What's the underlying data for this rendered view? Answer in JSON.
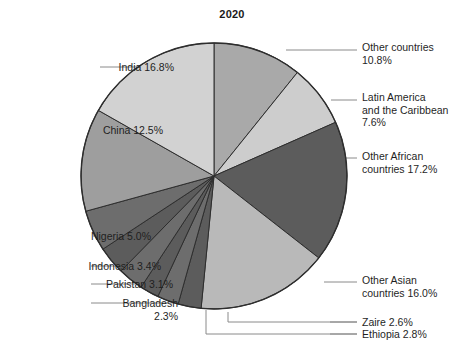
{
  "chart": {
    "title": "2020"
  },
  "chart_data": {
    "type": "pie",
    "title": "2020",
    "xlabel": "",
    "ylabel": "",
    "legend_position": "callout-labels",
    "grid": false,
    "units": "percent",
    "start_angle_deg": 0,
    "direction": "clockwise",
    "categories": [
      "Other countries",
      "Latin America and the Caribbean",
      "Other African countries",
      "Other Asian countries",
      "Ethiopia",
      "Zaire",
      "Bangladesh",
      "Pakistan",
      "Indonesia",
      "Nigeria",
      "China",
      "India"
    ],
    "values": [
      10.8,
      7.6,
      17.2,
      16.0,
      2.8,
      2.6,
      2.3,
      3.1,
      3.4,
      5.0,
      12.5,
      16.8
    ],
    "colors": [
      "#a9a9a9",
      "#cdcdcd",
      "#5c5c5c",
      "#b9b9b9",
      "#5c5c5c",
      "#6d6d6d",
      "#5c5c5c",
      "#6d6d6d",
      "#5c5c5c",
      "#6d6d6d",
      "#9e9e9e",
      "#d2d2d2"
    ],
    "slices": [
      {
        "label": "Other countries",
        "value": 10.8,
        "display": "Other countries\n10.8%",
        "color": "#a9a9a9"
      },
      {
        "label": "Latin America and the Caribbean",
        "value": 7.6,
        "display": "Latin America\nand the Caribbean\n7.6%",
        "color": "#cdcdcd"
      },
      {
        "label": "Other African countries",
        "value": 17.2,
        "display": "Other African\ncountries 17.2%",
        "color": "#5c5c5c"
      },
      {
        "label": "Other Asian countries",
        "value": 16.0,
        "display": "Other Asian\ncountries 16.0%",
        "color": "#b9b9b9"
      },
      {
        "label": "Ethiopia",
        "value": 2.8,
        "display": "Ethiopia 2.8%",
        "color": "#5c5c5c"
      },
      {
        "label": "Zaire",
        "value": 2.6,
        "display": "Zaire 2.6%",
        "color": "#6d6d6d"
      },
      {
        "label": "Bangladesh",
        "value": 2.3,
        "display": "Bangladesh\n2.3%",
        "color": "#5c5c5c"
      },
      {
        "label": "Pakistan",
        "value": 3.1,
        "display": "Pakistan 3.1%",
        "color": "#6d6d6d"
      },
      {
        "label": "Indonesia",
        "value": 3.4,
        "display": "Indonesia 3.4%",
        "color": "#5c5c5c"
      },
      {
        "label": "Nigeria",
        "value": 5.0,
        "display": "Nigeria 5.0%",
        "color": "#6d6d6d"
      },
      {
        "label": "China",
        "value": 12.5,
        "display": "China 12.5%",
        "color": "#9e9e9e"
      },
      {
        "label": "India",
        "value": 16.8,
        "display": "India 16.8%",
        "color": "#d2d2d2"
      }
    ]
  },
  "labels": {
    "other_countries": "Other countries\n10.8%",
    "latin_america": "Latin America\nand the Caribbean\n7.6%",
    "other_african": "Other African\ncountries 17.2%",
    "other_asian": "Other Asian\ncountries 16.0%",
    "zaire": "Zaire 2.6%",
    "ethiopia": "Ethiopia 2.8%",
    "bangladesh": "Bangladesh\n2.3%",
    "pakistan": "Pakistan 3.1%",
    "indonesia": "Indonesia 3.4%",
    "nigeria": "Nigeria 5.0%",
    "china": "China 12.5%",
    "india": "India 16.8%"
  }
}
